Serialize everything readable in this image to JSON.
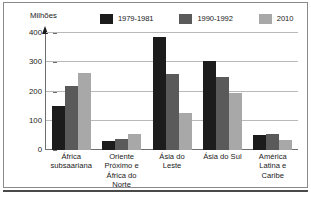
{
  "chart_data": {
    "type": "bar",
    "title": "",
    "ylabel": "Milhões",
    "xlabel": "",
    "ylim": [
      0,
      400
    ],
    "yticks": [
      0,
      100,
      200,
      300,
      400
    ],
    "grid": true,
    "legend_position": "top",
    "categories": [
      "África subsaariana",
      "Oriente Próximo e África do Norte",
      "Ásia do Leste",
      "Ásia do Sul",
      "América Latina e Caribe"
    ],
    "category_lines": [
      [
        "África",
        "subsaariana"
      ],
      [
        "Oriente",
        "Próximo e",
        "África do",
        "Norte"
      ],
      [
        "Ásia do",
        "Leste"
      ],
      [
        "Ásia do Sul"
      ],
      [
        "América",
        "Latina e",
        "Caribe"
      ]
    ],
    "series": [
      {
        "name": "1979-1981",
        "color": "#1c1c1c",
        "values": [
          150,
          30,
          385,
          305,
          50
        ]
      },
      {
        "name": "1990-1992",
        "color": "#5a5a5a",
        "values": [
          220,
          36,
          260,
          250,
          55
        ]
      },
      {
        "name": "2010",
        "color": "#a8a8a8",
        "values": [
          265,
          56,
          127,
          195,
          33
        ]
      }
    ]
  },
  "legend": {
    "items": [
      {
        "label": "1979-1981"
      },
      {
        "label": "1990-1992"
      },
      {
        "label": "2010"
      }
    ]
  },
  "yaxis": {
    "labels": [
      "400",
      "300",
      "200",
      "100",
      "0"
    ]
  }
}
